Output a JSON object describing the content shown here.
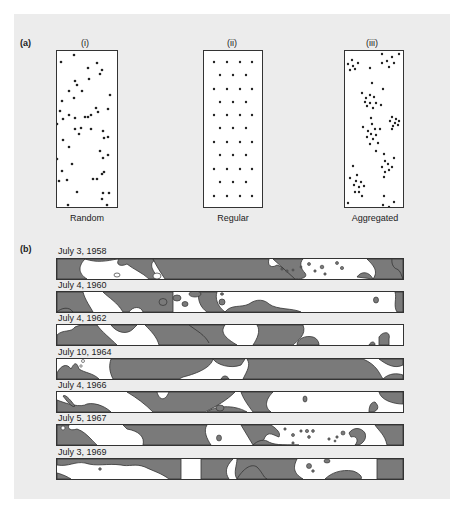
{
  "figure": {
    "panel_a": {
      "label": "(a)",
      "patterns": [
        {
          "numeral": "(i)",
          "caption": "Random"
        },
        {
          "numeral": "(ii)",
          "caption": "Regular"
        },
        {
          "numeral": "(iii)",
          "caption": "Aggregated"
        }
      ]
    },
    "panel_b": {
      "label": "(b)",
      "strips": [
        {
          "date": "July 3, 1958"
        },
        {
          "date": "July 4, 1960"
        },
        {
          "date": "July 4, 1962"
        },
        {
          "date": "July 10, 1964"
        },
        {
          "date": "July 4, 1966"
        },
        {
          "date": "July 5, 1967"
        },
        {
          "date": "July 3, 1969"
        }
      ]
    },
    "colors": {
      "background": "#ececec",
      "patch_fill": "#7a7a7a",
      "outline": "#333333",
      "dot": "#222222"
    }
  }
}
